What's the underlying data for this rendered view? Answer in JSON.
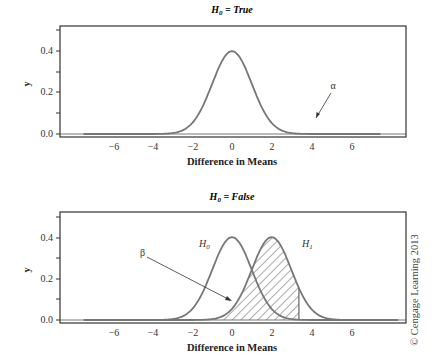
{
  "chart_data": [
    {
      "type": "line",
      "title": "H0 = True",
      "title_parts": {
        "main": "H",
        "sub": "0",
        "rest": " = True"
      },
      "xlabel": "Difference in Means",
      "ylabel": "y",
      "xlim": [
        -8.1,
        8.4
      ],
      "ylim": [
        -0.005,
        0.53
      ],
      "x_ticks": [
        -6,
        -4,
        -2,
        0,
        2,
        4,
        6
      ],
      "x_tick_labels": [
        "−6",
        "−4",
        "−2",
        "0",
        "2",
        "4",
        "6"
      ],
      "y_ticks": [
        0.0,
        0.2,
        0.4
      ],
      "y_tick_labels": [
        "0.0",
        "0.2",
        "0.4"
      ],
      "y_minor_ticks": [
        0.1,
        0.3,
        0.5
      ],
      "series": [
        {
          "name": "H0",
          "distribution": "normal",
          "mean": 0,
          "sd": 1.0,
          "x_range": [
            -7.5,
            7.5
          ],
          "peak": 0.4
        }
      ],
      "shaded_regions": [
        {
          "label": "α",
          "series": "H0",
          "from": 3.38,
          "to": 7.5,
          "fill": "solid",
          "color": "#b8b8b8"
        }
      ],
      "annotations": [
        {
          "text": "α",
          "x": 5.1,
          "y": 0.23,
          "arrow_to": [
            4.0,
            0.065
          ]
        }
      ],
      "grid": false,
      "legend": null
    },
    {
      "type": "line",
      "title": "H0 = False",
      "title_parts": {
        "main": "H",
        "sub": "0",
        "rest": " = False"
      },
      "xlabel": "Difference in Means",
      "ylabel": "y",
      "xlim": [
        -8.1,
        8.4
      ],
      "ylim": [
        -0.005,
        0.53
      ],
      "x_ticks": [
        -6,
        -4,
        -2,
        0,
        2,
        4,
        6
      ],
      "x_tick_labels": [
        "−6",
        "−4",
        "−2",
        "0",
        "2",
        "4",
        "6"
      ],
      "y_ticks": [
        0.0,
        0.2,
        0.4
      ],
      "y_tick_labels": [
        "0.0",
        "0.2",
        "0.4"
      ],
      "y_minor_ticks": [
        0.1,
        0.3,
        0.5
      ],
      "series": [
        {
          "name": "H0",
          "label": "H0",
          "distribution": "normal",
          "mean": 0,
          "sd": 1.0,
          "x_range": [
            -7.5,
            7.5
          ],
          "peak": 0.4
        },
        {
          "name": "H1",
          "label": "H1",
          "distribution": "normal",
          "mean": 2,
          "sd": 1.0,
          "x_range": [
            -5.5,
            9.5
          ],
          "peak": 0.4
        }
      ],
      "shaded_regions": [
        {
          "label": "β",
          "series": "H1",
          "from": -5.5,
          "to": 3.38,
          "fill": "hatched"
        }
      ],
      "annotations": [
        {
          "text": "β",
          "x": -4.2,
          "y": 0.31,
          "arrow_to": [
            0.0,
            0.095
          ]
        },
        {
          "text": "H0",
          "x": -1.8,
          "y": 0.36
        },
        {
          "text": "H1",
          "x": 3.6,
          "y": 0.36
        }
      ],
      "grid": false,
      "legend": null
    }
  ],
  "copyright": "© Cengage Learning 2013",
  "colors": {
    "curve": "#777777",
    "alpha_fill": "#b8b8b8",
    "hatch": "#555555",
    "axes": "#333333"
  }
}
